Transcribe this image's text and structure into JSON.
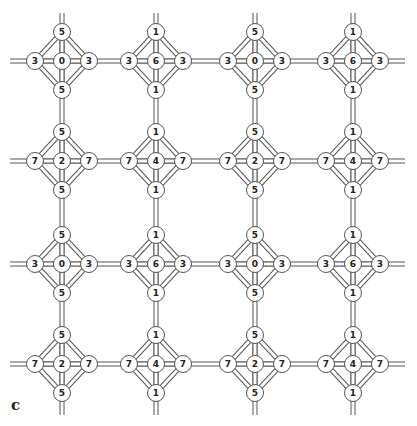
{
  "diagram": {
    "panel_label": "c",
    "colors": {
      "stroke": "#555555",
      "fill": "#ffffff",
      "text": "#222222"
    },
    "columns_x": [
      62,
      156,
      255,
      353
    ],
    "rows_y": [
      61,
      161,
      264,
      364
    ],
    "half_size": 29,
    "node_radius": 8.5,
    "rod_width": 5,
    "h_rod_extent": [
      10,
      405
    ],
    "v_rod_extent": [
      13,
      415
    ],
    "units": [
      {
        "row": 0,
        "col": 0,
        "top": "5",
        "left": "3",
        "center": "0",
        "right": "3",
        "bottom": "5"
      },
      {
        "row": 0,
        "col": 1,
        "top": "1",
        "left": "3",
        "center": "6",
        "right": "3",
        "bottom": "1"
      },
      {
        "row": 0,
        "col": 2,
        "top": "5",
        "left": "3",
        "center": "0",
        "right": "3",
        "bottom": "5"
      },
      {
        "row": 0,
        "col": 3,
        "top": "1",
        "left": "3",
        "center": "6",
        "right": "3",
        "bottom": "1"
      },
      {
        "row": 1,
        "col": 0,
        "top": "5",
        "left": "7",
        "center": "2",
        "right": "7",
        "bottom": "5"
      },
      {
        "row": 1,
        "col": 1,
        "top": "1",
        "left": "7",
        "center": "4",
        "right": "7",
        "bottom": "1"
      },
      {
        "row": 1,
        "col": 2,
        "top": "5",
        "left": "7",
        "center": "2",
        "right": "7",
        "bottom": "5"
      },
      {
        "row": 1,
        "col": 3,
        "top": "1",
        "left": "7",
        "center": "4",
        "right": "7",
        "bottom": "1"
      },
      {
        "row": 2,
        "col": 0,
        "top": "5",
        "left": "3",
        "center": "0",
        "right": "3",
        "bottom": "5"
      },
      {
        "row": 2,
        "col": 1,
        "top": "1",
        "left": "3",
        "center": "6",
        "right": "3",
        "bottom": "1"
      },
      {
        "row": 2,
        "col": 2,
        "top": "5",
        "left": "3",
        "center": "0",
        "right": "3",
        "bottom": "5"
      },
      {
        "row": 2,
        "col": 3,
        "top": "1",
        "left": "3",
        "center": "6",
        "right": "3",
        "bottom": "1"
      },
      {
        "row": 3,
        "col": 0,
        "top": "5",
        "left": "7",
        "center": "2",
        "right": "7",
        "bottom": "5"
      },
      {
        "row": 3,
        "col": 1,
        "top": "1",
        "left": "7",
        "center": "4",
        "right": "7",
        "bottom": "1"
      },
      {
        "row": 3,
        "col": 2,
        "top": "5",
        "left": "7",
        "center": "2",
        "right": "7",
        "bottom": "5"
      },
      {
        "row": 3,
        "col": 3,
        "top": "1",
        "left": "7",
        "center": "4",
        "right": "7",
        "bottom": "1"
      }
    ]
  }
}
